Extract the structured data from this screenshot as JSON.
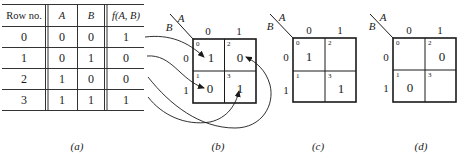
{
  "truth_table": {
    "headers": [
      "Row no.",
      "A",
      "B",
      "f(A, B)"
    ],
    "rows": [
      {
        "row": "0",
        "A": "0",
        "B": "0",
        "f": "1"
      },
      {
        "row": "1",
        "A": "0",
        "B": "1",
        "f": "0"
      },
      {
        "row": "2",
        "A": "1",
        "B": "0",
        "f": "0"
      },
      {
        "row": "3",
        "A": "1",
        "B": "1",
        "f": "1"
      }
    ],
    "caption": "(a)"
  },
  "maps": [
    {
      "id": "b",
      "var_col": "A",
      "var_row": "B",
      "col_labels": [
        "0",
        "1"
      ],
      "row_labels": [
        "0",
        "1"
      ],
      "cell_indices": [
        "0",
        "2",
        "1",
        "3"
      ],
      "cells": [
        "1",
        "0",
        "0",
        "1"
      ],
      "caption": "(b)"
    },
    {
      "id": "c",
      "var_col": "A",
      "var_row": "B",
      "col_labels": [
        "0",
        "1"
      ],
      "row_labels": [
        "0",
        "1"
      ],
      "cell_indices": [
        "0",
        "2",
        "1",
        "3"
      ],
      "cells": [
        "1",
        "",
        "",
        "1"
      ],
      "caption": "(c)"
    },
    {
      "id": "d",
      "var_col": "A",
      "var_row": "B",
      "col_labels": [
        "0",
        "1"
      ],
      "row_labels": [
        "0",
        "1"
      ],
      "cell_indices": [
        "0",
        "2",
        "1",
        "3"
      ],
      "cells": [
        "",
        "0",
        "0",
        ""
      ],
      "caption": "(d)"
    }
  ],
  "arrows": [
    {
      "from_row": "0",
      "to_cell": "0"
    },
    {
      "from_row": "1",
      "to_cell": "1"
    },
    {
      "from_row": "2",
      "to_cell": "2"
    },
    {
      "from_row": "3",
      "to_cell": "3"
    }
  ]
}
